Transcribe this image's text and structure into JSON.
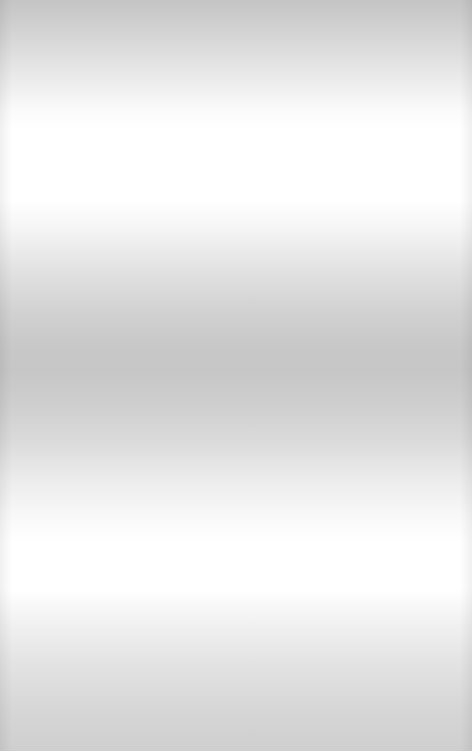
{
  "background": {
    "description": "blank banded grayscale gradient",
    "colors": {
      "light": "#ffffff",
      "mid": "#e0e0e0",
      "dark": "#c4c4c4"
    }
  }
}
